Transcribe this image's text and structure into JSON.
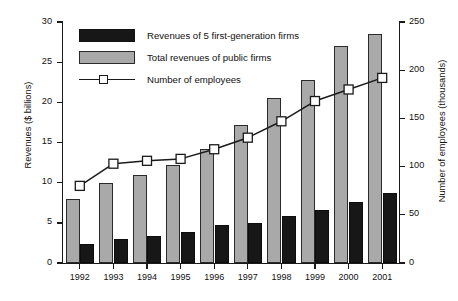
{
  "chart_data": {
    "type": "bar",
    "title": "",
    "subtitle": "",
    "categories": [
      "1992",
      "1993",
      "1994",
      "1995",
      "1996",
      "1997",
      "1998",
      "1999",
      "2000",
      "2001"
    ],
    "xlabel": "",
    "ylabel": "Revenues ($ billions)",
    "y2label": "Number of employees (thousands)",
    "ylim": [
      0,
      30
    ],
    "y2lim": [
      0,
      250
    ],
    "yticks": [
      0,
      5,
      10,
      15,
      20,
      25,
      30
    ],
    "y2ticks": [
      0,
      50,
      100,
      150,
      200,
      250
    ],
    "grid": false,
    "legend_position": "top-left",
    "series": [
      {
        "name": "Total revenues of public firms",
        "type": "bar",
        "axis": "left",
        "color": "#a9a9a9",
        "values": [
          8.0,
          10.0,
          11.0,
          12.2,
          14.2,
          17.2,
          20.6,
          22.8,
          27.0,
          28.5
        ]
      },
      {
        "name": "Revenues of 5 first-generation firms",
        "type": "bar",
        "axis": "left",
        "color": "#171717",
        "values": [
          2.4,
          3.0,
          3.4,
          3.9,
          4.7,
          5.0,
          5.9,
          6.6,
          7.6,
          8.7
        ]
      },
      {
        "name": "Number of employees",
        "type": "line",
        "axis": "right",
        "color": "#1a1a1a",
        "marker": "square-open",
        "values": [
          80,
          103,
          106,
          108,
          118,
          130,
          147,
          168,
          180,
          192
        ]
      }
    ]
  },
  "legend": {
    "items": [
      {
        "label": "Revenues of 5 first-generation firms",
        "style": "black-swatch"
      },
      {
        "label": "Total revenues of public firms",
        "style": "gray-swatch"
      },
      {
        "label": "Number of employees",
        "style": "line-marker"
      }
    ]
  },
  "axes": {
    "left_title": "Revenues ($ billions)",
    "right_title": "Number of employees (thousands)",
    "left_ticks": [
      "0",
      "5",
      "10",
      "15",
      "20",
      "25",
      "30"
    ],
    "right_ticks": [
      "0",
      "50",
      "100",
      "150",
      "200",
      "250"
    ],
    "x_ticks": [
      "1992",
      "1993",
      "1994",
      "1995",
      "1996",
      "1997",
      "1998",
      "1999",
      "2000",
      "2001"
    ]
  },
  "colors": {
    "gray_bar": "#a9a9a9",
    "black_bar": "#171717",
    "line": "#1a1a1a",
    "axis": "#1a1a1a",
    "background": "#ffffff"
  }
}
